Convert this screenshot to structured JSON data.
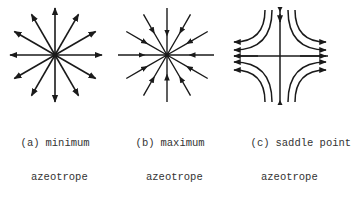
{
  "figure": {
    "panels": [
      {
        "id": "a",
        "tag": "(a)",
        "label_line1": "minimum",
        "label_line2": "azeotrope",
        "type": "unstable-node",
        "arrow_direction": "outward",
        "ray_count": 12
      },
      {
        "id": "b",
        "tag": "(b)",
        "label_line1": "maximum",
        "label_line2": "azeotrope",
        "type": "stable-node",
        "arrow_direction": "inward",
        "ray_count": 12
      },
      {
        "id": "c",
        "tag": "(c)",
        "label_line1": "saddle point",
        "label_line2": "azeotrope",
        "type": "saddle",
        "arrow_direction": "vertical-in-horizontal-out"
      }
    ],
    "colors": {
      "ink": "#1a1a1a",
      "text": "#333333",
      "background": "#ffffff"
    }
  }
}
